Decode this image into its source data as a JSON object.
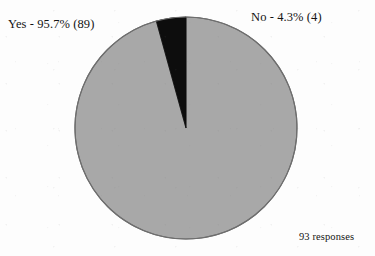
{
  "chart_data": {
    "type": "pie",
    "title": "",
    "subtitle": "",
    "xlabel": "",
    "ylabel": "",
    "legend_position": "none",
    "grid": false,
    "total_responses": 93,
    "caption": "93 responses",
    "labels": [
      "Yes",
      "No"
    ],
    "values": [
      89,
      4
    ],
    "percentages": [
      95.7,
      4.3
    ],
    "categories": [
      {
        "name": "Yes",
        "count": 89,
        "percent": 95.7,
        "label_text": "Yes - 95.7% (89)",
        "color": "#a8a8a8",
        "start_angle_deg": 15.5,
        "end_angle_deg": 360
      },
      {
        "name": "No",
        "count": 4,
        "percent": 4.3,
        "label_text": "No - 4.3% (4)",
        "color": "#0d0d0d",
        "start_angle_deg": 0,
        "end_angle_deg": 15.5
      }
    ],
    "geometry": {
      "center_x": 186,
      "center_y": 128,
      "radius": 111,
      "start_at_top": true,
      "direction": "clockwise"
    },
    "colors": {
      "background": "#fdfdfd",
      "slice_yes": "#a8a8a8",
      "slice_no": "#0d0d0d",
      "outline": "#6e6e6e",
      "text": "#141414"
    }
  },
  "labels": {
    "yes": "Yes - 95.7% (89)",
    "no": "No - 4.3% (4)",
    "responses": "93 responses"
  }
}
